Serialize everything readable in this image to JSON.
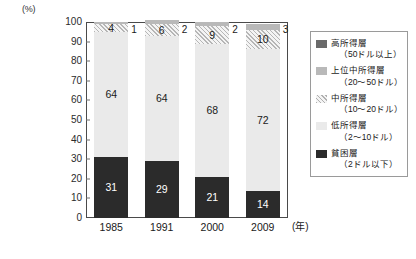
{
  "chart_data": {
    "type": "bar",
    "subtype": "100% stacked column",
    "title": "",
    "xlabel": "(年)",
    "ylabel": "(%)",
    "ylim": [
      0,
      100
    ],
    "ytick_step": 10,
    "yticks": [
      "100",
      "90",
      "80",
      "70",
      "60",
      "50",
      "40",
      "30",
      "20",
      "10",
      "0"
    ],
    "categories": [
      "1985",
      "1991",
      "2000",
      "2009"
    ],
    "grid": false,
    "legend_position": "right",
    "series": [
      {
        "name": "貧困層",
        "key": "poverty",
        "color": "#2b2b2b",
        "values": [
          31,
          29,
          21,
          14
        ]
      },
      {
        "name": "低所得層",
        "key": "low",
        "color": "#eaeaea",
        "values": [
          64,
          64,
          68,
          72
        ]
      },
      {
        "name": "中所得層",
        "key": "mid",
        "color": "#f4f4f4",
        "values": [
          4,
          6,
          9,
          10
        ]
      },
      {
        "name": "上位中所得層",
        "key": "uppermid",
        "color": "#b9b9b9",
        "values": [
          1,
          2,
          2,
          3
        ]
      },
      {
        "name": "高所得層",
        "key": "high",
        "color": "#6a6a6a",
        "values": [
          0,
          0,
          0,
          1
        ]
      }
    ],
    "bars": [
      {
        "category": "1985",
        "segments": [
          {
            "key": "poverty",
            "value": 31,
            "label": "31",
            "label_position": "inside"
          },
          {
            "key": "low",
            "value": 64,
            "label": "64",
            "label_position": "inside"
          },
          {
            "key": "mid",
            "value": 4,
            "label": "4",
            "label_position": "inside"
          },
          {
            "key": "uppermid",
            "value": 1,
            "label": "1",
            "label_position": "outside"
          }
        ]
      },
      {
        "category": "1991",
        "segments": [
          {
            "key": "poverty",
            "value": 29,
            "label": "29",
            "label_position": "inside"
          },
          {
            "key": "low",
            "value": 64,
            "label": "64",
            "label_position": "inside"
          },
          {
            "key": "mid",
            "value": 6,
            "label": "6",
            "label_position": "inside"
          },
          {
            "key": "uppermid",
            "value": 2,
            "label": "2",
            "label_position": "outside"
          }
        ]
      },
      {
        "category": "2000",
        "segments": [
          {
            "key": "poverty",
            "value": 21,
            "label": "21",
            "label_position": "inside"
          },
          {
            "key": "low",
            "value": 68,
            "label": "68",
            "label_position": "inside"
          },
          {
            "key": "mid",
            "value": 9,
            "label": "9",
            "label_position": "inside"
          },
          {
            "key": "uppermid",
            "value": 2,
            "label": "2",
            "label_position": "outside"
          }
        ]
      },
      {
        "category": "2009",
        "segments": [
          {
            "key": "poverty",
            "value": 14,
            "label": "14",
            "label_position": "inside"
          },
          {
            "key": "low",
            "value": 72,
            "label": "72",
            "label_position": "inside"
          },
          {
            "key": "mid",
            "value": 10,
            "label": "10",
            "label_position": "inside"
          },
          {
            "key": "uppermid",
            "value": 3,
            "label": "3",
            "label_position": "outside"
          }
        ]
      }
    ],
    "legend": [
      {
        "name": "高所得層",
        "range": "（50ドル以上）",
        "key": "high"
      },
      {
        "name": "上位中所得層",
        "range": "（20〜50ドル）",
        "key": "uppermid"
      },
      {
        "name": "中所得層",
        "range": "（10〜20ドル）",
        "key": "mid"
      },
      {
        "name": "低所得層",
        "range": "（2〜10ドル）",
        "key": "low"
      },
      {
        "name": "貧困層",
        "range": "（2ドル以下）",
        "key": "poverty"
      }
    ]
  }
}
